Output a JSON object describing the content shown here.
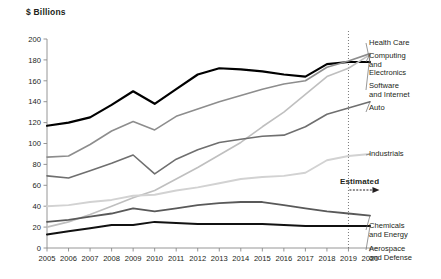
{
  "chart_data": {
    "type": "line",
    "title": "$ Billions",
    "xlabel": "",
    "ylabel": "$ Billions",
    "ylim": [
      0,
      200
    ],
    "ytick_step": 20,
    "grid": false,
    "legend_position": "right-inline-labels",
    "categories": [
      "2005",
      "2006",
      "2007",
      "2008",
      "2009",
      "2010",
      "2011",
      "2012",
      "2013",
      "2014",
      "2015",
      "2016",
      "2017",
      "2018",
      "2019",
      "2020"
    ],
    "annotations": [
      {
        "text": "Estimated",
        "x": "2019",
        "note": "dotted vertical divider at 2019 with right arrow"
      }
    ],
    "series": [
      {
        "name": "Health Care",
        "color": "#000000",
        "width": 2.2,
        "values": [
          117,
          120,
          125,
          137,
          150,
          138,
          152,
          166,
          172,
          171,
          169,
          166,
          164,
          176,
          178,
          178
        ]
      },
      {
        "name": "Computing\nand\nElectronics",
        "color": "#8d8d8d",
        "width": 1.6,
        "values": [
          87,
          88,
          99,
          112,
          121,
          113,
          126,
          133,
          140,
          146,
          152,
          157,
          160,
          173,
          179,
          186
        ]
      },
      {
        "name": "Software\nand Internet",
        "color": "#bfbfbf",
        "width": 1.6,
        "values": [
          20,
          25,
          32,
          40,
          48,
          55,
          66,
          77,
          89,
          101,
          116,
          130,
          147,
          164,
          172,
          185
        ]
      },
      {
        "name": "Auto",
        "color": "#6f6f6f",
        "width": 1.6,
        "values": [
          69,
          67,
          74,
          81,
          89,
          71,
          85,
          94,
          101,
          104,
          107,
          108,
          116,
          128,
          134,
          140
        ]
      },
      {
        "name": "Industrials",
        "color": "#d2d2d2",
        "width": 1.9,
        "values": [
          40,
          41,
          44,
          46,
          50,
          51,
          55,
          58,
          62,
          66,
          68,
          69,
          72,
          84,
          88,
          90
        ]
      },
      {
        "name": "Chemicals\nand Energy",
        "color": "#595959",
        "width": 1.8,
        "values": [
          25,
          27,
          30,
          33,
          38,
          35,
          38,
          41,
          43,
          44,
          44,
          41,
          38,
          35,
          33,
          31
        ]
      },
      {
        "name": "Aerospace\nand Defense",
        "color": "#111111",
        "width": 2.0,
        "values": [
          13,
          16,
          19,
          22,
          22,
          25,
          24,
          23,
          23,
          23,
          23,
          22,
          21,
          21,
          21,
          21
        ]
      }
    ]
  },
  "labels": {
    "axis_title": "$ Billions",
    "estimated": "Estimated",
    "health_care": "Health Care",
    "computing": "Computing\nand\nElectronics",
    "software": "Software\nand Internet",
    "auto": "Auto",
    "industrials": "Industrials",
    "chemicals": "Chemicals\nand Energy",
    "aerospace": "Aerospace\nand Defense"
  }
}
